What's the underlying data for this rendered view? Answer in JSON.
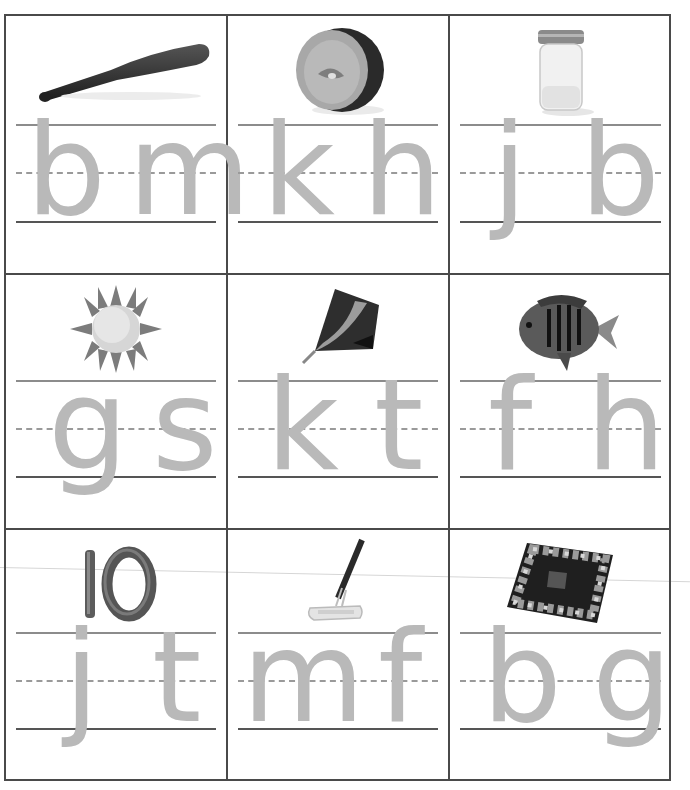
{
  "worksheet": {
    "layout": {
      "rows": 3,
      "columns": 3
    },
    "colors": {
      "border": "#4a4a4a",
      "letter": "#b9b9b9",
      "baseline": "#555555",
      "midline": "#9a9a9a"
    },
    "cards": [
      {
        "picture": "baseball bat",
        "icon": "bat-icon",
        "letters": [
          "b",
          "m"
        ]
      },
      {
        "picture": "kiwi",
        "icon": "kiwi-icon",
        "letters": [
          "k",
          "h"
        ]
      },
      {
        "picture": "jar",
        "icon": "jar-icon",
        "letters": [
          "j",
          "b"
        ]
      },
      {
        "picture": "sun",
        "icon": "sun-icon",
        "letters": [
          "g",
          "s"
        ]
      },
      {
        "picture": "kite",
        "icon": "kite-icon",
        "letters": [
          "k",
          "t"
        ]
      },
      {
        "picture": "fish",
        "icon": "fish-icon",
        "letters": [
          "f",
          "h"
        ]
      },
      {
        "picture": "ten",
        "icon": "ten-icon",
        "number_label": "10",
        "letters": [
          "j",
          "t"
        ]
      },
      {
        "picture": "mop",
        "icon": "mop-icon",
        "letters": [
          "m",
          "f"
        ]
      },
      {
        "picture": "game board",
        "icon": "game-board-icon",
        "letters": [
          "b",
          "g"
        ]
      }
    ]
  }
}
